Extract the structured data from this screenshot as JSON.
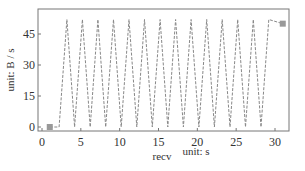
{
  "chart_data": {
    "type": "line",
    "title": "",
    "xlabel": "recv",
    "xunit": "unit: s",
    "ylabel": "unit: B / s",
    "xlim": [
      -0.5,
      32
    ],
    "ylim": [
      -2,
      57.5
    ],
    "xticks": [
      0,
      5,
      10,
      15,
      20,
      25,
      30
    ],
    "yticks": [
      0,
      15,
      30,
      45
    ],
    "grid": false,
    "legend": null,
    "series": [
      {
        "name": "recv",
        "color": "#888888",
        "dashed": true,
        "marker_points": [
          [
            1,
            0
          ],
          [
            31,
            50
          ]
        ],
        "x": [
          1,
          2.2,
          3.2,
          4.2,
          5.2,
          6.2,
          7.2,
          8.2,
          9.2,
          10.2,
          11.2,
          12.2,
          13.2,
          14.2,
          15.2,
          16.2,
          17.2,
          18.2,
          19.2,
          20.2,
          21.2,
          22.2,
          23.2,
          24.2,
          25.2,
          26.2,
          27.2,
          28.2,
          29.2,
          31
        ],
        "y": [
          0,
          0,
          52,
          0,
          52,
          0,
          52,
          0,
          52,
          0,
          52,
          0,
          52,
          0,
          52,
          0,
          52,
          0,
          52,
          0,
          52,
          0,
          52,
          0,
          52,
          0,
          52,
          0,
          52,
          50
        ]
      }
    ]
  }
}
